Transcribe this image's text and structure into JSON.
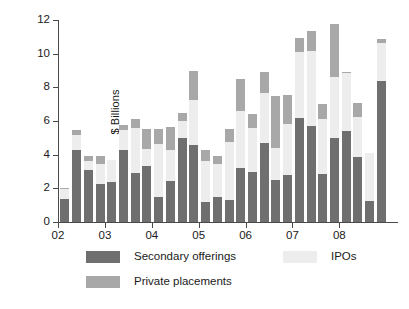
{
  "chart_data": {
    "type": "bar",
    "subtype": "stacked-vertical",
    "title": "",
    "xlabel": "",
    "ylabel": "$ Billions",
    "ylim": [
      0,
      12
    ],
    "yticks": [
      0,
      2,
      4,
      6,
      8,
      10,
      12
    ],
    "ytick_labels": [
      "0",
      "2",
      "4",
      "6",
      "8",
      "10",
      "12"
    ],
    "grid": false,
    "legend_position": "below-axes",
    "xtick_labels": [
      "02",
      "03",
      "04",
      "05",
      "06",
      "07",
      "08"
    ],
    "xtick_values": [
      2002,
      2003,
      2004,
      2005,
      2006,
      2007,
      2008
    ],
    "categories": [
      "02Q1",
      "02Q2",
      "02Q3",
      "02Q4",
      "03Q1",
      "03Q2",
      "03Q3",
      "03Q4",
      "04Q1",
      "04Q2",
      "04Q3",
      "04Q4",
      "05Q1",
      "05Q2",
      "05Q3",
      "05Q4",
      "06Q1",
      "06Q2",
      "06Q3",
      "06Q4",
      "07Q1",
      "07Q2",
      "07Q3",
      "07Q4",
      "08Q1",
      "08Q2",
      "08Q3",
      "08Q4"
    ],
    "series": [
      {
        "name": "Secondary offerings",
        "color": "#6f6f6f",
        "values": [
          1.35,
          4.3,
          3.1,
          2.25,
          2.4,
          4.3,
          2.9,
          3.35,
          1.5,
          2.45,
          5.0,
          4.6,
          1.2,
          1.5,
          1.3,
          3.2,
          2.95,
          4.7,
          2.5,
          2.8,
          6.15,
          5.7,
          2.85,
          5.0,
          5.4,
          3.85,
          1.25,
          8.4
        ]
      },
      {
        "name": "IPOs",
        "color": "#ededed",
        "values": [
          0.6,
          0.85,
          0.55,
          1.2,
          1.3,
          1.15,
          2.7,
          1.0,
          3.15,
          1.85,
          1.0,
          2.65,
          2.45,
          1.95,
          3.45,
          3.4,
          2.65,
          2.95,
          1.9,
          3.05,
          3.95,
          4.45,
          3.25,
          3.6,
          3.45,
          2.4,
          2.85,
          2.25
        ]
      },
      {
        "name": "Private placements",
        "color": "#a8a8a8",
        "values": [
          0.1,
          0.3,
          0.25,
          0.5,
          0.0,
          0.3,
          0.5,
          1.15,
          0.85,
          1.35,
          0.45,
          1.7,
          0.6,
          0.45,
          0.75,
          1.9,
          0.8,
          1.25,
          3.1,
          1.7,
          0.85,
          1.2,
          0.9,
          3.15,
          0.05,
          0.8,
          0.0,
          0.25
        ]
      }
    ],
    "totals": [
      2.05,
      5.45,
      3.9,
      3.95,
      3.7,
      5.75,
      6.1,
      5.5,
      5.5,
      5.65,
      6.45,
      8.95,
      4.25,
      3.9,
      5.5,
      8.5,
      6.4,
      8.9,
      7.5,
      7.55,
      10.95,
      11.35,
      7.0,
      11.75,
      8.9,
      7.05,
      4.1,
      10.9
    ]
  },
  "legend": {
    "entries": [
      {
        "label": "Secondary offerings",
        "color": "#6f6f6f"
      },
      {
        "label": "IPOs",
        "color": "#ededed"
      },
      {
        "label": "Private placements",
        "color": "#a8a8a8"
      }
    ]
  },
  "axes": {
    "y_title": "$ Billions"
  }
}
